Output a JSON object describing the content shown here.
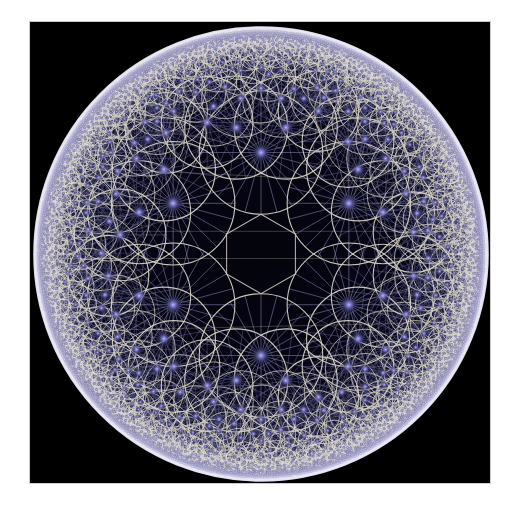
{
  "figure": {
    "background_color": "#ffffff",
    "panel_color": "#000000",
    "panel": {
      "x": 30,
      "y": 22,
      "width": 460,
      "height": 461
    },
    "disk": {
      "cx": 261,
      "cy": 254,
      "r": 227
    },
    "colors": {
      "background": "#ffffff",
      "panel": "#000000",
      "circle_outline": "#d8d4c4",
      "boundary_rim": "#e8e6f2",
      "spoke": "#6f6d9e",
      "spoke_bright": "#9a97c8",
      "hub_core": "#8f8cd8",
      "hub_glow": "#3b3a72",
      "disk_fill": "#03030a",
      "panel_border": "#a0a0aa"
    },
    "geometry": {
      "model": "poincare-disk",
      "spokes_per_circle": 24,
      "recursion_depth": 7,
      "seed_ring_count": 6,
      "seed_ring_radius_frac": 0.447,
      "seed_circle_radius_frac": 0.272,
      "center_gap": true,
      "rim_band_fraction": 0.955
    }
  },
  "chart_data": {
    "type": "scatter",
    "xlabel": "",
    "ylabel": "",
    "xlim": [
      -1,
      1
    ],
    "ylim": [
      -1,
      1
    ],
    "grid": false,
    "legend": "none",
    "series": [
      {
        "name": "generation-1 circles",
        "points": [
          {
            "x": 0.0,
            "y": -0.447,
            "r": 0.272
          },
          {
            "x": 0.387,
            "y": -0.224,
            "r": 0.272
          },
          {
            "x": 0.387,
            "y": 0.224,
            "r": 0.272
          },
          {
            "x": 0.0,
            "y": 0.447,
            "r": 0.272
          },
          {
            "x": -0.387,
            "y": 0.224,
            "r": 0.272
          },
          {
            "x": -0.387,
            "y": -0.224,
            "r": 0.272
          }
        ]
      }
    ]
  }
}
